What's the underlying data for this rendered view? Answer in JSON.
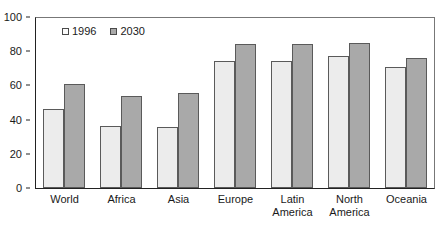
{
  "chart_data": {
    "type": "bar",
    "title": "",
    "subtitle": "",
    "xlabel": "",
    "ylabel": "",
    "ylim": [
      0,
      100
    ],
    "yticks": [
      0,
      20,
      40,
      60,
      80,
      100
    ],
    "grid": false,
    "legend_position": "top-left-inside",
    "categories": [
      "World",
      "Africa",
      "Asia",
      "Europe",
      "Latin America",
      "North America",
      "Oceania"
    ],
    "category_lines": [
      [
        "World"
      ],
      [
        "Africa"
      ],
      [
        "Asia"
      ],
      [
        "Europe"
      ],
      [
        "Latin",
        "America"
      ],
      [
        "North",
        "America"
      ],
      [
        "Oceania"
      ]
    ],
    "series": [
      {
        "name": "1996",
        "color": "#ececec",
        "values": [
          46,
          36.5,
          35.5,
          74,
          74.5,
          77,
          71
        ]
      },
      {
        "name": "2030",
        "color": "#a9a9a9",
        "values": [
          61,
          54,
          55.5,
          84,
          84.5,
          85,
          76
        ]
      }
    ]
  },
  "legend": {
    "items": [
      {
        "label": "1996",
        "swatch": "legend-swatch-1996"
      },
      {
        "label": "2030",
        "swatch": "legend-swatch-2030"
      }
    ]
  }
}
